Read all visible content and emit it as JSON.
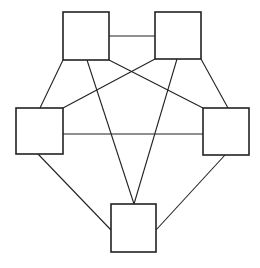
{
  "diagram": {
    "type": "complete-graph-K5",
    "colors": {
      "stroke": "#222222",
      "fill": "#ffffff",
      "background": "#ffffff"
    },
    "nodes": [
      {
        "id": "top-left",
        "x": 63,
        "y": 12,
        "w": 46,
        "h": 48
      },
      {
        "id": "top-right",
        "x": 155,
        "y": 12,
        "w": 46,
        "h": 47
      },
      {
        "id": "middle-left",
        "x": 16,
        "y": 108,
        "w": 47,
        "h": 46
      },
      {
        "id": "middle-right",
        "x": 203,
        "y": 108,
        "w": 46,
        "h": 47
      },
      {
        "id": "bottom",
        "x": 111,
        "y": 204,
        "w": 45,
        "h": 48
      }
    ],
    "edges": [
      {
        "from": "top-left",
        "to": "top-right",
        "x1": 109,
        "y1": 36,
        "x2": 155,
        "y2": 36
      },
      {
        "from": "top-left",
        "to": "middle-left",
        "x1": 63,
        "y1": 60,
        "x2": 40,
        "y2": 108
      },
      {
        "from": "top-left",
        "to": "bottom",
        "x1": 87,
        "y1": 60,
        "x2": 134,
        "y2": 204
      },
      {
        "from": "top-left",
        "to": "middle-right",
        "x1": 109,
        "y1": 60,
        "x2": 203,
        "y2": 108
      },
      {
        "from": "top-right",
        "to": "middle-left",
        "x1": 155,
        "y1": 59,
        "x2": 63,
        "y2": 108
      },
      {
        "from": "top-right",
        "to": "bottom",
        "x1": 177,
        "y1": 59,
        "x2": 134,
        "y2": 204
      },
      {
        "from": "top-right",
        "to": "middle-right",
        "x1": 201,
        "y1": 59,
        "x2": 228,
        "y2": 108
      },
      {
        "from": "middle-left",
        "to": "middle-right",
        "x1": 63,
        "y1": 134,
        "x2": 203,
        "y2": 134
      },
      {
        "from": "middle-left",
        "to": "bottom",
        "x1": 38,
        "y1": 154,
        "x2": 111,
        "y2": 230
      },
      {
        "from": "middle-right",
        "to": "bottom",
        "x1": 225,
        "y1": 155,
        "x2": 156,
        "y2": 230
      }
    ]
  }
}
